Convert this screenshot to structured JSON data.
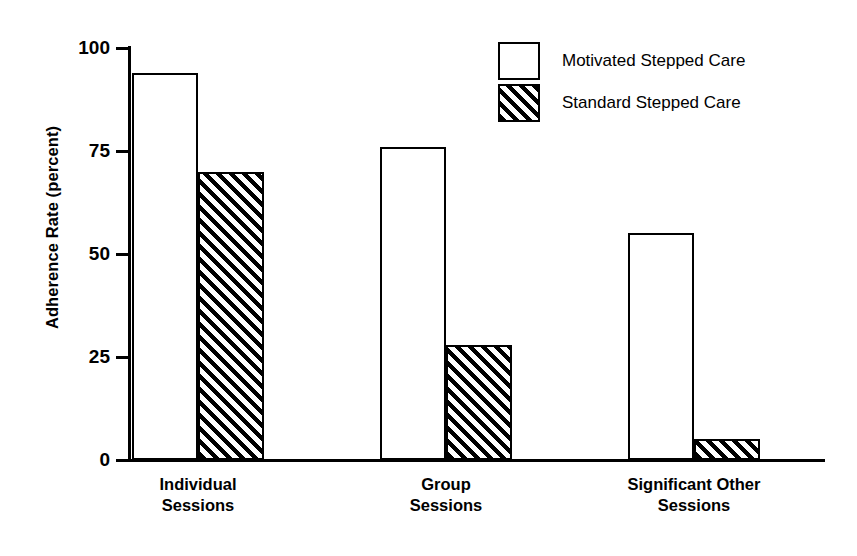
{
  "chart_data": {
    "type": "bar",
    "title": "",
    "subtitle": "",
    "xlabel": "",
    "ylabel": "Adherence Rate (percent)",
    "ylim": [
      0,
      100
    ],
    "yticks": [
      0,
      25,
      50,
      75,
      100
    ],
    "ytick_labels": [
      "0",
      "25",
      "50",
      "75",
      "100"
    ],
    "grid": false,
    "legend_position": "top-right",
    "categories": [
      "Individual\nSessions",
      "Group\nSessions",
      "Significant Other\nSessions"
    ],
    "category_lines": [
      {
        "line1": "Individual",
        "line2": "Sessions"
      },
      {
        "line1": "Group",
        "line2": "Sessions"
      },
      {
        "line1": "Significant Other",
        "line2": "Sessions"
      }
    ],
    "series": [
      {
        "name": "Motivated Stepped Care",
        "fill": "open",
        "values": [
          94,
          76,
          55
        ]
      },
      {
        "name": "Standard Stepped Care",
        "fill": "diagonal-hatch",
        "values": [
          70,
          28,
          5
        ]
      }
    ]
  },
  "legend": {
    "items": [
      {
        "label": "Motivated Stepped Care",
        "swatch": "open-square"
      },
      {
        "label": "Standard Stepped Care",
        "swatch": "hatched-square"
      }
    ]
  },
  "colors": {
    "foreground": "#000000",
    "background": "#ffffff",
    "bar_outline": "#000000",
    "hatch": "#000000"
  }
}
